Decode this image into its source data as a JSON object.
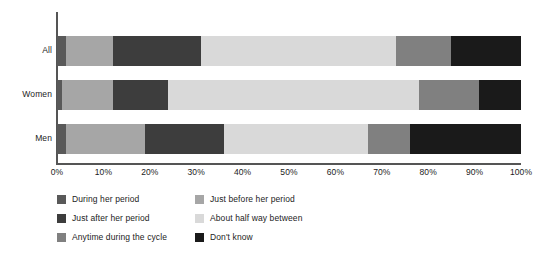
{
  "chart_data": {
    "type": "bar",
    "orientation": "horizontal",
    "stacked": true,
    "stack_mode": "percent",
    "title": "",
    "subtitle": "",
    "xlabel": "",
    "ylabel": "",
    "xlim": [
      0,
      100
    ],
    "grid": false,
    "legend_position": "bottom",
    "categories": [
      "All",
      "Women",
      "Men"
    ],
    "series": [
      {
        "name": "During her period",
        "color": "#595959",
        "values": [
          2,
          1,
          2
        ]
      },
      {
        "name": "Just before her period",
        "color": "#a6a6a6",
        "values": [
          10,
          11,
          17
        ]
      },
      {
        "name": "Just after her period",
        "color": "#3d3d3d",
        "values": [
          19,
          12,
          17
        ]
      },
      {
        "name": "About half way between",
        "color": "#d9d9d9",
        "values": [
          42,
          54,
          31
        ]
      },
      {
        "name": "Anytime during the cycle",
        "color": "#808080",
        "values": [
          12,
          13,
          9
        ]
      },
      {
        "name": "Don't know",
        "color": "#1a1a1a",
        "values": [
          15,
          9,
          24
        ]
      }
    ],
    "xticks": [
      {
        "value": 0,
        "label": "0%"
      },
      {
        "value": 10,
        "label": "10%"
      },
      {
        "value": 20,
        "label": "20%"
      },
      {
        "value": 30,
        "label": "30%"
      },
      {
        "value": 40,
        "label": "40%"
      },
      {
        "value": 50,
        "label": "50%"
      },
      {
        "value": 60,
        "label": "60%"
      },
      {
        "value": 70,
        "label": "70%"
      },
      {
        "value": 80,
        "label": "80%"
      },
      {
        "value": 90,
        "label": "90%"
      },
      {
        "value": 100,
        "label": "100%"
      }
    ],
    "legend_items": [
      {
        "label": "During her period",
        "color": "#595959",
        "col": 0,
        "row": 0
      },
      {
        "label": "Just after her period",
        "color": "#3d3d3d",
        "col": 0,
        "row": 1
      },
      {
        "label": "Anytime during the cycle",
        "color": "#808080",
        "col": 0,
        "row": 2
      },
      {
        "label": "Just before her period",
        "color": "#a6a6a6",
        "col": 1,
        "row": 0
      },
      {
        "label": "About half way between",
        "color": "#d9d9d9",
        "col": 1,
        "row": 1
      },
      {
        "label": "Don't know",
        "color": "#1a1a1a",
        "col": 1,
        "row": 2
      }
    ]
  },
  "axis": {
    "line_color": "#555555"
  },
  "canvas": {
    "background": "#ffffff"
  }
}
